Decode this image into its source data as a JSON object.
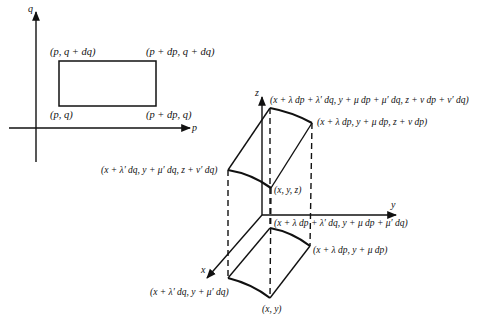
{
  "diagram": {
    "type": "coordinate-mapping-figure",
    "left_panel": {
      "axes": {
        "horizontal": "p",
        "vertical": "q"
      },
      "corners": {
        "bottom_left": "(p, q)",
        "top_left": "(p, q + dq)",
        "top_right": "(p + dp, q + dq)",
        "bottom_right": "(p + dp, q)"
      }
    },
    "right_panel": {
      "axes": {
        "x": "x",
        "y": "y",
        "z": "z"
      },
      "top_surface": {
        "far_corner": "(x + λ dp + λ′ dq, y + μ dp + μ′ dq, z + ν dp + ν′ dq)",
        "right_corner": "(x + λ dp, y + μ dp, z + ν dp)",
        "left_corner": "(x + λ′ dq, y + μ′ dq, z + ν′ dq)",
        "base_corner": "(x, y, z)"
      },
      "projection": {
        "far_corner": "(x + λ dp + λ′ dq, y + μ dp + μ′ dq)",
        "right_corner": "(x + λ dp, y + μ dp)",
        "left_corner": "(x + λ′ dq, y + μ′ dq)",
        "base_corner": "(x, y)"
      }
    }
  }
}
